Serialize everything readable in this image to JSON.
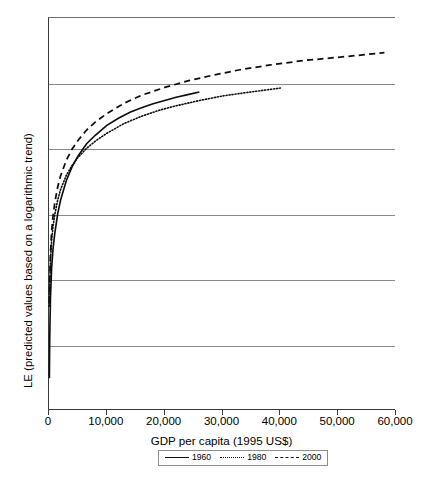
{
  "chart_data": {
    "type": "line",
    "title": "",
    "xlabel": "GDP per capita (1995 US$)",
    "ylabel": "LE (predicted values based on a logarithmic trend)",
    "xlim": [
      0,
      60000
    ],
    "ylim": [
      30,
      90
    ],
    "xticks": [
      0,
      10000,
      20000,
      30000,
      40000,
      50000,
      60000
    ],
    "xtick_labels": [
      "0",
      "10,000",
      "20,000",
      "30,000",
      "40,000",
      "50,000",
      "60,000"
    ],
    "yticks": [
      30,
      40,
      50,
      60,
      70,
      80,
      90
    ],
    "ytick_labels": [
      "30",
      "40",
      "50",
      "60",
      "70",
      "80",
      "90"
    ],
    "grid": "horizontal",
    "legend_position": "below-axis-center",
    "legend_entries": [
      {
        "label": "1960",
        "style": "solid"
      },
      {
        "label": "1980",
        "style": "dotted"
      },
      {
        "label": "2000",
        "style": "dashed"
      }
    ],
    "series": [
      {
        "name": "1960",
        "style": "solid",
        "x": [
          60,
          120,
          250,
          450,
          700,
          1000,
          1500,
          2000,
          3000,
          4000,
          5000,
          6500,
          8000,
          10000,
          12000,
          14000,
          16000,
          18000,
          20000,
          22000,
          24000,
          26000
        ],
        "values": [
          35.0,
          40.8,
          47.2,
          51.8,
          54.8,
          57.1,
          60.1,
          62.2,
          65.2,
          67.3,
          68.9,
          70.8,
          72.1,
          73.6,
          74.7,
          75.6,
          76.3,
          76.9,
          77.4,
          77.9,
          78.3,
          78.7
        ]
      },
      {
        "name": "1980",
        "style": "dotted",
        "x": [
          60,
          120,
          250,
          450,
          700,
          1000,
          1500,
          2000,
          3000,
          4000,
          5000,
          6500,
          8000,
          10000,
          13000,
          16000,
          19000,
          22000,
          26000,
          30000,
          34000,
          40000
        ],
        "values": [
          46.0,
          49.2,
          53.0,
          56.0,
          58.2,
          60.0,
          62.2,
          63.8,
          66.0,
          67.5,
          68.7,
          70.1,
          71.2,
          72.4,
          73.9,
          75.0,
          75.9,
          76.6,
          77.4,
          78.1,
          78.6,
          79.3
        ]
      },
      {
        "name": "2000",
        "style": "dashed",
        "x": [
          60,
          120,
          250,
          450,
          700,
          1000,
          1500,
          2000,
          3000,
          4000,
          5000,
          6500,
          8000,
          10000,
          13000,
          16000,
          20000,
          24000,
          28000,
          33000,
          38000,
          44000,
          50000,
          58000
        ],
        "values": [
          46.5,
          49.8,
          54.0,
          57.4,
          59.8,
          61.8,
          64.2,
          65.9,
          68.3,
          70.0,
          71.3,
          72.9,
          74.1,
          75.4,
          77.0,
          78.2,
          79.4,
          80.4,
          81.2,
          82.1,
          82.8,
          83.5,
          84.0,
          84.7
        ]
      }
    ]
  }
}
